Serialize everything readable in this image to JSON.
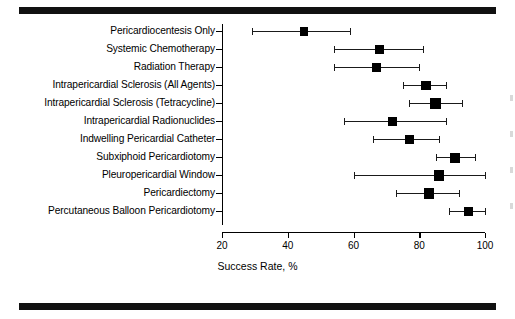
{
  "figure": {
    "name": "forest-plot-success-rate",
    "xlabel": "Success Rate, %",
    "background": "#ffffff",
    "ink_color": "#000000"
  },
  "chart_data": {
    "type": "scatter",
    "title": "",
    "subtitle": "",
    "xlabel": "Success Rate, %",
    "ylabel": "",
    "xlim": [
      20,
      100
    ],
    "xticks": [
      20,
      40,
      60,
      80,
      100
    ],
    "xtick_labels": [
      "20",
      "40",
      "60",
      "80",
      "100"
    ],
    "grid": false,
    "legend": "none",
    "orientation": "horizontal",
    "error_bars": "95% confidence interval",
    "categories": [
      "Pericardiocentesis Only",
      "Systemic Chemotherapy",
      "Radiation Therapy",
      "Intrapericardial Sclerosis (All Agents)",
      "Intrapericardial Sclerosis (Tetracycline)",
      "Intrapericardial Radionuclides",
      "Indwelling Pericardial Catheter",
      "Subxiphoid Pericardiotomy",
      "Pleuropericardial Window",
      "Pericardiectomy",
      "Percutaneous Balloon Pericardiotomy"
    ],
    "values": [
      45,
      68,
      67,
      82,
      85,
      72,
      77,
      91,
      86,
      83,
      95
    ],
    "ci_low": [
      29,
      54,
      54,
      75,
      77,
      57,
      66,
      85,
      60,
      73,
      89
    ],
    "ci_high": [
      59,
      81,
      80,
      88,
      93,
      88,
      86,
      97,
      100,
      92,
      100
    ],
    "points": [
      {
        "label": "Pericardiocentesis Only",
        "value": 45,
        "ci_low": 29,
        "ci_high": 59
      },
      {
        "label": "Systemic Chemotherapy",
        "value": 68,
        "ci_low": 54,
        "ci_high": 81
      },
      {
        "label": "Radiation Therapy",
        "value": 67,
        "ci_low": 54,
        "ci_high": 80
      },
      {
        "label": "Intrapericardial Sclerosis (All Agents)",
        "value": 82,
        "ci_low": 75,
        "ci_high": 88
      },
      {
        "label": "Intrapericardial Sclerosis (Tetracycline)",
        "value": 85,
        "ci_low": 77,
        "ci_high": 93
      },
      {
        "label": "Intrapericardial Radionuclides",
        "value": 72,
        "ci_low": 57,
        "ci_high": 88
      },
      {
        "label": "Indwelling Pericardial Catheter",
        "value": 77,
        "ci_low": 66,
        "ci_high": 86
      },
      {
        "label": "Subxiphoid Pericardiotomy",
        "value": 91,
        "ci_low": 85,
        "ci_high": 97
      },
      {
        "label": "Pleuropericardial Window",
        "value": 86,
        "ci_low": 60,
        "ci_high": 100
      },
      {
        "label": "Pericardiectomy",
        "value": 83,
        "ci_low": 73,
        "ci_high": 92
      },
      {
        "label": "Percutaneous Balloon Pericardiotomy",
        "value": 95,
        "ci_low": 89,
        "ci_high": 100
      }
    ]
  }
}
